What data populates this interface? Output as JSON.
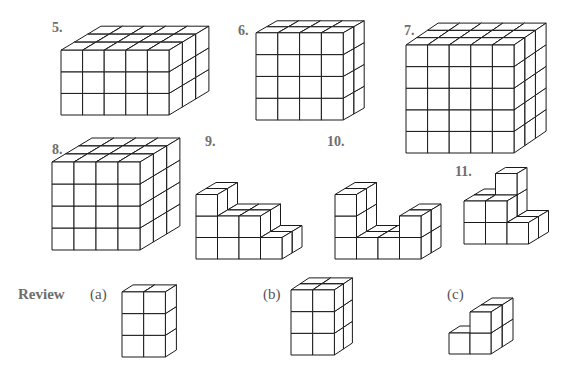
{
  "page": {
    "section_label": "Review",
    "stroke_color": "#1a1a1a",
    "label_color": "#6e6e6e",
    "background": "#ffffff"
  },
  "figures": [
    {
      "id": "5",
      "label": "5.",
      "label_pos": [
        52,
        21
      ],
      "origin": [
        61,
        115
      ],
      "size": 21.6,
      "dx": 13.3,
      "dy": -8,
      "depth_rows": [
        [
          3,
          3,
          3,
          3,
          3
        ],
        [
          3,
          3,
          3,
          3,
          3
        ],
        [
          3,
          3,
          3,
          3,
          3
        ]
      ]
    },
    {
      "id": "6",
      "label": "6.",
      "label_pos": [
        238,
        24
      ],
      "origin": [
        256,
        120
      ],
      "size": 21.8,
      "dx": 10.5,
      "dy": -6,
      "depth_rows": [
        [
          4,
          4,
          4,
          4
        ],
        [
          4,
          4,
          4,
          4
        ]
      ]
    },
    {
      "id": "7",
      "label": "7.",
      "label_pos": [
        404,
        24
      ],
      "origin": [
        406,
        153
      ],
      "size": 21.6,
      "dx": 10.7,
      "dy": -7.3,
      "depth_rows": [
        [
          5,
          5,
          5,
          5,
          5
        ],
        [
          5,
          5,
          5,
          5,
          5
        ],
        [
          5,
          5,
          5,
          5,
          5
        ]
      ]
    },
    {
      "id": "8",
      "label": "8.",
      "label_pos": [
        52,
        143
      ],
      "origin": [
        52,
        250
      ],
      "size": 22,
      "dx": 13.3,
      "dy": -8,
      "depth_rows": [
        [
          4,
          4,
          4,
          4
        ],
        [
          4,
          4,
          4,
          4
        ],
        [
          4,
          4,
          4,
          4
        ]
      ]
    },
    {
      "id": "9",
      "label": "9.",
      "label_pos": [
        205,
        135
      ],
      "origin": [
        196,
        259
      ],
      "size": 21.5,
      "dx": 10,
      "dy": -6,
      "depth_rows": [
        [
          3,
          2,
          2,
          1
        ],
        [
          3,
          2,
          2,
          1
        ]
      ]
    },
    {
      "id": "10",
      "label": "10.",
      "label_pos": [
        327,
        135
      ],
      "origin": [
        335,
        259
      ],
      "size": 21.5,
      "dx": 10,
      "dy": -6,
      "depth_rows": [
        [
          3,
          1,
          1,
          2
        ],
        [
          3,
          1,
          1,
          2
        ]
      ]
    },
    {
      "id": "11",
      "label": "11.",
      "label_pos": [
        455,
        165
      ],
      "origin": [
        464,
        244
      ],
      "size": 21.5,
      "dx": 10,
      "dy": -6,
      "depth_rows": [
        [
          2,
          2,
          1
        ],
        [
          2,
          3,
          1
        ]
      ]
    }
  ],
  "review": {
    "label": "Review",
    "label_pos": [
      18,
      287
    ],
    "items": [
      {
        "id": "a",
        "label": "(a)",
        "label_pos": [
          90,
          287
        ],
        "origin": [
          122,
          357
        ],
        "size": 21.7,
        "dx": 11,
        "dy": -7,
        "depth_rows": [
          [
            3,
            3
          ]
        ]
      },
      {
        "id": "b",
        "label": "(b)",
        "label_pos": [
          263,
          287
        ],
        "origin": [
          291,
          355
        ],
        "size": 21.7,
        "dx": 9,
        "dy": -6,
        "depth_rows": [
          [
            3,
            3
          ],
          [
            3,
            3
          ]
        ]
      },
      {
        "id": "c",
        "label": "(c)",
        "label_pos": [
          447,
          287
        ],
        "origin": [
          449,
          354
        ],
        "size": 21,
        "dx": 11,
        "dy": -7,
        "depth_rows": [
          [
            1,
            2
          ],
          [
            0,
            2
          ]
        ]
      }
    ]
  }
}
